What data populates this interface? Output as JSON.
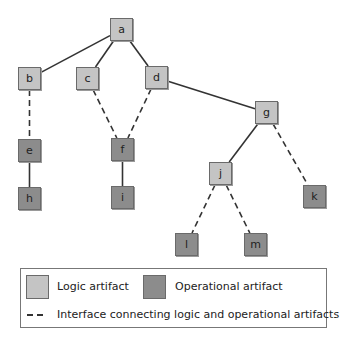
{
  "diagram": {
    "nodes": [
      {
        "id": "a",
        "label": "a",
        "type": "logic",
        "x": 110,
        "y": 18
      },
      {
        "id": "b",
        "label": "b",
        "type": "logic",
        "x": 18,
        "y": 67
      },
      {
        "id": "c",
        "label": "c",
        "type": "logic",
        "x": 76,
        "y": 67
      },
      {
        "id": "d",
        "label": "d",
        "type": "logic",
        "x": 145,
        "y": 66
      },
      {
        "id": "g",
        "label": "g",
        "type": "logic",
        "x": 255,
        "y": 101
      },
      {
        "id": "e",
        "label": "e",
        "type": "operational",
        "x": 18,
        "y": 139
      },
      {
        "id": "f",
        "label": "f",
        "type": "operational",
        "x": 111,
        "y": 138
      },
      {
        "id": "j",
        "label": "j",
        "type": "logic",
        "x": 209,
        "y": 162
      },
      {
        "id": "h",
        "label": "h",
        "type": "operational",
        "x": 18,
        "y": 187
      },
      {
        "id": "i",
        "label": "i",
        "type": "operational",
        "x": 111,
        "y": 186
      },
      {
        "id": "k",
        "label": "k",
        "type": "operational",
        "x": 303,
        "y": 185
      },
      {
        "id": "l",
        "label": "l",
        "type": "operational",
        "x": 175,
        "y": 233
      },
      {
        "id": "m",
        "label": "m",
        "type": "operational",
        "x": 244,
        "y": 233
      }
    ],
    "edges": [
      {
        "from": "a",
        "to": "b",
        "style": "solid"
      },
      {
        "from": "a",
        "to": "c",
        "style": "solid"
      },
      {
        "from": "a",
        "to": "d",
        "style": "solid"
      },
      {
        "from": "d",
        "to": "g",
        "style": "solid"
      },
      {
        "from": "b",
        "to": "e",
        "style": "dashed"
      },
      {
        "from": "c",
        "to": "f",
        "style": "dashed"
      },
      {
        "from": "d",
        "to": "f",
        "style": "dashed"
      },
      {
        "from": "e",
        "to": "h",
        "style": "solid"
      },
      {
        "from": "f",
        "to": "i",
        "style": "solid"
      },
      {
        "from": "g",
        "to": "j",
        "style": "solid"
      },
      {
        "from": "g",
        "to": "k",
        "style": "dashed"
      },
      {
        "from": "j",
        "to": "l",
        "style": "dashed"
      },
      {
        "from": "j",
        "to": "m",
        "style": "dashed"
      }
    ]
  },
  "legend": {
    "logic_label": "Logic artifact",
    "operational_label": "Operational artifact",
    "interface_label": "Interface connecting logic and operational artifacts"
  },
  "colors": {
    "logic": "#c4c4c4",
    "operational": "#8c8c8c",
    "line": "#333333"
  }
}
